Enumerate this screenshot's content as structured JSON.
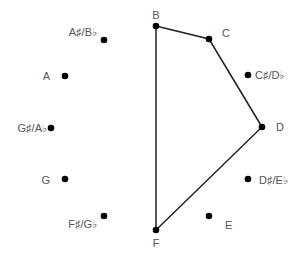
{
  "diagram": {
    "type": "pitch-class circle",
    "dot_color": "#000000",
    "line_color": "#222222",
    "label_color": "#555555",
    "notes": [
      {
        "id": "B",
        "label": "B",
        "x": 156,
        "y": 26,
        "lx": 156,
        "ly": 19,
        "anchor": "middle"
      },
      {
        "id": "C",
        "label": "C",
        "x": 209,
        "y": 39,
        "lx": 222,
        "ly": 37,
        "anchor": "start"
      },
      {
        "id": "Cs",
        "label": "C♯/D♭",
        "x": 248,
        "y": 75,
        "lx": 255,
        "ly": 79,
        "anchor": "start"
      },
      {
        "id": "D",
        "label": "D",
        "x": 262,
        "y": 127,
        "lx": 276,
        "ly": 131,
        "anchor": "start"
      },
      {
        "id": "Ds",
        "label": "D♯/E♭",
        "x": 248,
        "y": 179,
        "lx": 259,
        "ly": 184,
        "anchor": "start"
      },
      {
        "id": "E",
        "label": "E",
        "x": 209,
        "y": 216,
        "lx": 225,
        "ly": 229,
        "anchor": "start"
      },
      {
        "id": "F",
        "label": "F",
        "x": 156,
        "y": 230,
        "lx": 156,
        "ly": 247,
        "anchor": "middle"
      },
      {
        "id": "Fs",
        "label": "F♯/G♭",
        "x": 104,
        "y": 216,
        "lx": 97,
        "ly": 228,
        "anchor": "end"
      },
      {
        "id": "G",
        "label": "G",
        "x": 65,
        "y": 179,
        "lx": 50,
        "ly": 184,
        "anchor": "end"
      },
      {
        "id": "Gs",
        "label": "G♯/A♭",
        "x": 51,
        "y": 128,
        "lx": 47,
        "ly": 132,
        "anchor": "end"
      },
      {
        "id": "A",
        "label": "A",
        "x": 65,
        "y": 76,
        "lx": 50,
        "ly": 80,
        "anchor": "end"
      },
      {
        "id": "As",
        "label": "A♯/B♭",
        "x": 104,
        "y": 40,
        "lx": 97,
        "ly": 36,
        "anchor": "end"
      }
    ],
    "polygon": [
      "B",
      "C",
      "D",
      "F"
    ]
  }
}
